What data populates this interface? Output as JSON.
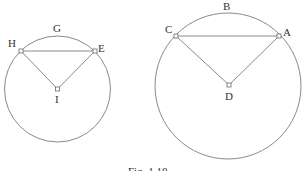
{
  "figure": {
    "caption": "Fig. 1.18",
    "stroke_color": "#8a8a8a",
    "label_color": "#333333",
    "left_diagram": {
      "circle": {
        "cx": 57.5,
        "cy": 89,
        "r": 53
      },
      "arc_label": {
        "text": "G",
        "x": 57,
        "y": 32
      },
      "points": {
        "H": {
          "label": "H",
          "x": 21,
          "y": 51,
          "label_x": 8,
          "label_y": 47
        },
        "E": {
          "label": "E",
          "x": 95,
          "y": 51,
          "label_x": 98,
          "label_y": 52
        },
        "I": {
          "label": "I",
          "x": 57.5,
          "y": 89,
          "label_x": 55,
          "label_y": 103
        }
      },
      "segments": [
        [
          "H",
          "E"
        ],
        [
          "H",
          "I"
        ],
        [
          "E",
          "I"
        ]
      ]
    },
    "right_diagram": {
      "circle": {
        "cx": 228,
        "cy": 86,
        "r": 73
      },
      "arc_label": {
        "text": "B",
        "x": 227,
        "y": 10
      },
      "points": {
        "C": {
          "label": "C",
          "x": 176,
          "y": 36,
          "label_x": 165,
          "label_y": 33
        },
        "A": {
          "label": "A",
          "x": 279,
          "y": 36,
          "label_x": 283,
          "label_y": 36
        },
        "D": {
          "label": "D",
          "x": 229,
          "y": 85,
          "label_x": 225,
          "label_y": 100
        }
      },
      "segments": [
        [
          "C",
          "A"
        ],
        [
          "C",
          "D"
        ],
        [
          "A",
          "D"
        ]
      ]
    }
  }
}
